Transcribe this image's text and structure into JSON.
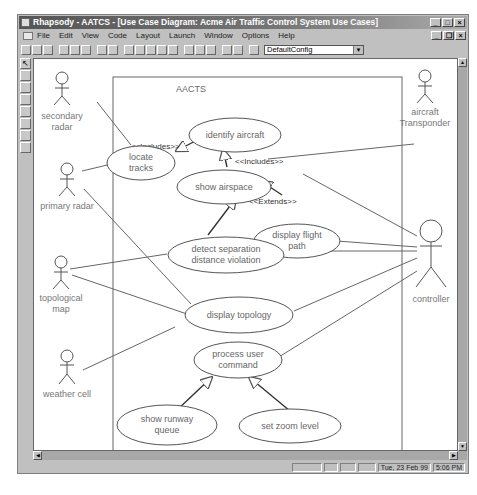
{
  "window": {
    "title": "Rhapsody - AATCS - [Use Case Diagram: Acme Air Traffic Control System Use Cases]",
    "buttons": [
      "minimize",
      "maximize",
      "close"
    ]
  },
  "menubar": {
    "items": [
      "File",
      "Edit",
      "View",
      "Code",
      "Layout",
      "Launch",
      "Window",
      "Options",
      "Help"
    ]
  },
  "toolbar": {
    "config_select": "DefaultConfig"
  },
  "palette": {
    "tools": [
      "select-arrow",
      "tool-2",
      "tool-3",
      "tool-4",
      "tool-5",
      "tool-6",
      "tool-7",
      "tool-8"
    ]
  },
  "diagram": {
    "system_boundary": "AACTS",
    "actors": {
      "secondary_radar": [
        "secondary",
        "radar"
      ],
      "primary_radar": "primary radar",
      "topological_map": [
        "topological",
        "map"
      ],
      "weather_cell": "weather cell",
      "aircraft_transponder": [
        "aircraft",
        "Transponder"
      ],
      "controller": "controller"
    },
    "use_cases": {
      "identify_aircraft": "identify aircraft",
      "locate_tracks": [
        "locate",
        "tracks"
      ],
      "show_airspace": "show airspace",
      "display_flight_path": [
        "display flight",
        "path"
      ],
      "detect_separation": [
        "detect separation",
        "distance violation"
      ],
      "display_topology": "display topology",
      "process_user_command": [
        "process user",
        "command"
      ],
      "show_runway_queue": [
        "show runway",
        "queue"
      ],
      "set_zoom_level": "set zoom level"
    },
    "stereotypes": {
      "includes_left": "<<Includes>>",
      "includes_right": "<<Includes>>",
      "extends": "<<Extends>>"
    }
  },
  "statusbar": {
    "date": "Tue, 23 Feb 99",
    "time": "5:06 PM"
  }
}
